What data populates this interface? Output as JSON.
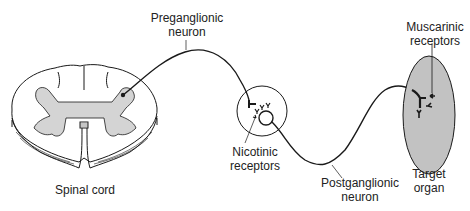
{
  "diagram": {
    "type": "autonomic-nervous-system-pathway",
    "labels": {
      "preganglionic": [
        "Preganglionic",
        "neuron"
      ],
      "spinal_cord": [
        "Spinal cord"
      ],
      "nicotinic": [
        "Nicotinic",
        "receptors"
      ],
      "postganglionic": [
        "Postganglionic",
        "neuron"
      ],
      "muscarinic": [
        "Muscarinic",
        "receptors"
      ],
      "target_organ": [
        "Target",
        "organ"
      ]
    },
    "colors": {
      "line": "#1a1a1a",
      "gray_matter": "#d4d4d4",
      "organ_fill": "#c2c2c2",
      "background": "#ffffff"
    }
  }
}
